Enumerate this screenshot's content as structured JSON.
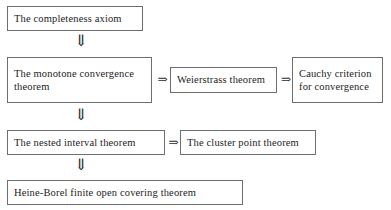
{
  "diagram": {
    "background_color": "#ffffff",
    "border_color": "#6e6e6e",
    "text_color": "#1c1c1c",
    "nodes": {
      "completeness_axiom": {
        "lines": [
          "The completeness axiom"
        ]
      },
      "monotone_convergence": {
        "lines": [
          "The monotone convergence",
          "theorem"
        ]
      },
      "weierstrass": {
        "lines": [
          "Weierstrass theorem"
        ]
      },
      "cauchy_criterion": {
        "lines": [
          "Cauchy criterion",
          "for convergence"
        ]
      },
      "nested_interval": {
        "lines": [
          "The nested interval theorem"
        ]
      },
      "cluster_point": {
        "lines": [
          "The cluster point theorem"
        ]
      },
      "heine_borel": {
        "lines": [
          "Heine-Borel finite open covering theorem"
        ]
      }
    },
    "arrows": {
      "down_glyph": "⇓",
      "right_glyph": "⇒",
      "a1_completeness_to_monotone": "⇓",
      "a2_monotone_to_weierstrass": "⇒",
      "a3_weierstrass_to_cauchy": "⇒",
      "a4_monotone_to_nested": "⇓",
      "a5_nested_to_cluster": "⇒",
      "a6_nested_to_heineborel": "⇓"
    }
  }
}
